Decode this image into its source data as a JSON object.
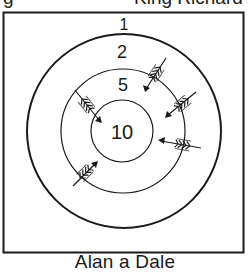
{
  "header": {
    "left_fragment": "g",
    "right_fragment": "King Richard"
  },
  "target": {
    "center": [
      123,
      131
    ],
    "rings": [
      {
        "name": "outer",
        "radius": 97,
        "score_label": "1",
        "label_position": "above-outer-ring"
      },
      {
        "name": "middle-outer",
        "radius": 97,
        "score_label": "2"
      },
      {
        "name": "middle",
        "radius": 62,
        "score_label": "5"
      },
      {
        "name": "bullseye",
        "radius": 31,
        "score_label": "10"
      }
    ],
    "score_labels": {
      "outermost": "1",
      "second": "2",
      "third": "5",
      "center": "10"
    },
    "arrows": [
      {
        "id": 1,
        "tail": [
          166,
          58
        ],
        "tip": [
          145,
          91
        ],
        "ring_hit": "5"
      },
      {
        "id": 2,
        "tail": [
          196,
          92
        ],
        "tip": [
          166,
          117
        ],
        "ring_hit": "5"
      },
      {
        "id": 3,
        "tail": [
          201,
          148
        ],
        "tip": [
          159,
          140
        ],
        "ring_hit": "5"
      },
      {
        "id": 4,
        "tail": [
          75,
          90
        ],
        "tip": [
          101,
          122
        ],
        "ring_hit": "10"
      },
      {
        "id": 5,
        "tail": [
          73,
          186
        ],
        "tip": [
          97,
          162
        ],
        "ring_hit": "5"
      }
    ]
  },
  "caption": "Alan a Dale",
  "colors": {
    "ink": "#1a1a1a",
    "background": "#ffffff"
  }
}
